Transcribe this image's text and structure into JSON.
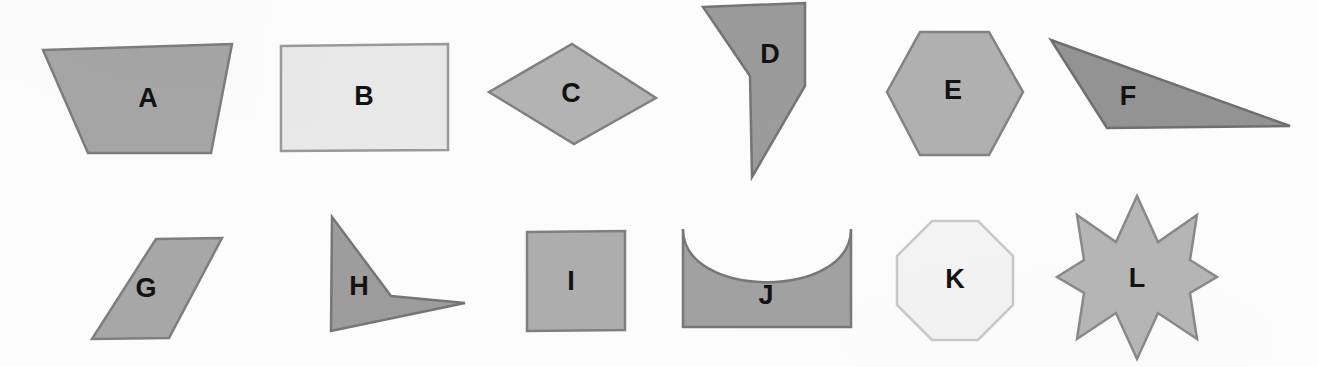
{
  "page": {
    "background_color": "#fdfdfd",
    "width": 1318,
    "height": 367,
    "rows": 2,
    "columns": 6,
    "total_shapes": 12
  },
  "palette": {
    "medium_gray_fill": "#a8a8a8",
    "dark_gray_fill": "#8f8f8f",
    "light_gray_fill": "#c2c2c2",
    "very_light_fill": "#e8e8e8",
    "near_white_fill": "#f4f4f4",
    "outline": "#7a7a7a",
    "dark_outline": "#6d6d6d",
    "label_color": "#121212"
  },
  "shapes": [
    {
      "label": "A",
      "name": "trapezoid",
      "row": 1,
      "column": 1,
      "fill": "#a6a6a6",
      "stroke": "#7d7d7d",
      "label_x": 148,
      "label_y": 100,
      "points": "43,50 232,44 211,153 88,153"
    },
    {
      "label": "B",
      "name": "rectangle",
      "row": 1,
      "column": 2,
      "fill": "#eaeaea",
      "stroke": "#9a9a9a",
      "label_x": 364,
      "label_y": 98,
      "points": "281,46 448,44 448,150 281,151"
    },
    {
      "label": "C",
      "name": "rhombus",
      "row": 1,
      "column": 3,
      "fill": "#b4b4b4",
      "stroke": "#818181",
      "label_x": 571,
      "label_y": 95,
      "points": "489,92 572,44 656,98 574,144"
    },
    {
      "label": "D",
      "name": "concave-arrow-quadrilateral",
      "row": 1,
      "column": 4,
      "fill": "#9b9b9b",
      "stroke": "#757575",
      "label_x": 770,
      "label_y": 56,
      "points": "703,7 805,3 805,86 752,177 750,76"
    },
    {
      "label": "E",
      "name": "hexagon",
      "row": 1,
      "column": 5,
      "fill": "#b0b0b0",
      "stroke": "#838383",
      "label_x": 953,
      "label_y": 92,
      "points": "920,32 989,32 1023,92 989,155 920,155 887,92"
    },
    {
      "label": "F",
      "name": "obtuse-triangle",
      "row": 1,
      "column": 6,
      "fill": "#939393",
      "stroke": "#6f6f6f",
      "label_x": 1128,
      "label_y": 98,
      "points": "1051,40 1290,126 1107,128"
    },
    {
      "label": "G",
      "name": "parallelogram",
      "row": 2,
      "column": 1,
      "fill": "#a8a8a8",
      "stroke": "#7f7f7f",
      "label_x": 146,
      "label_y": 290,
      "points": "156,239 222,238 169,338 92,339"
    },
    {
      "label": "H",
      "name": "concave-arrow-triangle",
      "row": 2,
      "column": 2,
      "fill": "#9d9d9d",
      "stroke": "#767676",
      "label_x": 359,
      "label_y": 288,
      "points": "332,217 391,296 465,303 331,331"
    },
    {
      "label": "I",
      "name": "square",
      "row": 2,
      "column": 3,
      "fill": "#aeaeae",
      "stroke": "#808080",
      "label_x": 571,
      "label_y": 283,
      "points": "527,232 625,231 625,330 527,331"
    },
    {
      "label": "J",
      "name": "concave-rectangle-arc",
      "row": 2,
      "column": 4,
      "fill": "#a2a2a2",
      "stroke": "#787878",
      "label_x": 766,
      "label_y": 297,
      "path": "M 683,229 L 683,327 L 851,327 L 851,229 C 851,300 683,300 683,229 Z"
    },
    {
      "label": "K",
      "name": "octagon",
      "row": 2,
      "column": 5,
      "fill": "#f4f4f4",
      "stroke": "#c9c9c9",
      "label_x": 955,
      "label_y": 281,
      "points": "932,221 978,221 1013,256 1013,305 978,340 932,340 897,305 897,256"
    },
    {
      "label": "L",
      "name": "eight-pointed-star",
      "row": 2,
      "column": 6,
      "fill": "#b6b6b6",
      "stroke": "#8a8a8a",
      "label_x": 1137,
      "label_y": 280,
      "points": "1137,196 1158,242 1197,215 1190,260 1217,277 1190,293 1197,339 1158,313 1137,359 1116,313 1077,339 1084,293 1057,277 1084,260 1077,215 1116,242"
    }
  ]
}
